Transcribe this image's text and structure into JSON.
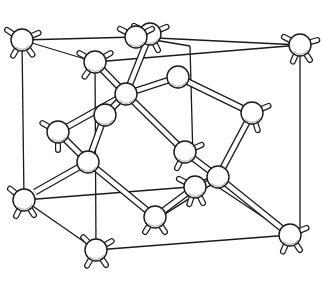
{
  "diagram": {
    "colors": {
      "ink": "#1a1a1a",
      "background": "#ffffff",
      "atom_fill": "#ffffff"
    },
    "atom_radius": 11,
    "cube_edges": [
      [
        22,
        40,
        136,
        37
      ],
      [
        136,
        37,
        300,
        45
      ],
      [
        22,
        40,
        95,
        62
      ],
      [
        136,
        37,
        190,
        46
      ],
      [
        95,
        62,
        300,
        45
      ],
      [
        22,
        40,
        24,
        200
      ],
      [
        95,
        62,
        96,
        250
      ],
      [
        300,
        45,
        300,
        235
      ],
      [
        190,
        46,
        193,
        160
      ],
      [
        24,
        200,
        96,
        250
      ],
      [
        96,
        250,
        290,
        235
      ],
      [
        24,
        200,
        215,
        185
      ],
      [
        215,
        185,
        290,
        235
      ]
    ],
    "bonds": [
      [
        95,
        62,
        126,
        94
      ],
      [
        150,
        34,
        126,
        94
      ],
      [
        126,
        94,
        178,
        77
      ],
      [
        126,
        94,
        58,
        132
      ],
      [
        126,
        94,
        105,
        115
      ],
      [
        126,
        94,
        185,
        152
      ],
      [
        178,
        77,
        252,
        113
      ],
      [
        252,
        113,
        218,
        177
      ],
      [
        58,
        132,
        88,
        162
      ],
      [
        88,
        162,
        35,
        192
      ],
      [
        88,
        162,
        155,
        217
      ],
      [
        88,
        162,
        105,
        115
      ],
      [
        185,
        152,
        218,
        177
      ],
      [
        218,
        177,
        290,
        235
      ],
      [
        218,
        177,
        195,
        187
      ],
      [
        155,
        217,
        218,
        177
      ],
      [
        155,
        217,
        195,
        187
      ]
    ],
    "atoms": [
      {
        "id": "corner-top-back-left",
        "x": 22,
        "y": 40,
        "stubs": [
          [
            -12,
            -8
          ],
          [
            -8,
            14
          ],
          [
            10,
            14
          ],
          [
            14,
            -6
          ]
        ]
      },
      {
        "id": "face-top",
        "x": 150,
        "y": 34,
        "stubs": [
          [
            -12,
            -6
          ],
          [
            14,
            -6
          ],
          [
            6,
            12
          ]
        ]
      },
      {
        "id": "corner-top-back-right",
        "x": 136,
        "y": 37,
        "stubs": [
          [
            -12,
            -6
          ],
          [
            12,
            -6
          ]
        ]
      },
      {
        "id": "corner-top-front-left",
        "x": 95,
        "y": 62,
        "stubs": [
          [
            -14,
            -8
          ],
          [
            14,
            -8
          ],
          [
            -10,
            14
          ]
        ]
      },
      {
        "id": "corner-top-front-right",
        "x": 300,
        "y": 45,
        "stubs": [
          [
            -12,
            -6
          ],
          [
            14,
            -4
          ],
          [
            -6,
            14
          ],
          [
            8,
            12
          ]
        ]
      },
      {
        "id": "interior-1",
        "x": 126,
        "y": 94,
        "stubs": []
      },
      {
        "id": "face-back",
        "x": 178,
        "y": 77,
        "stubs": []
      },
      {
        "id": "face-right",
        "x": 252,
        "y": 113,
        "stubs": [
          [
            14,
            -6
          ],
          [
            4,
            12
          ]
        ]
      },
      {
        "id": "face-left",
        "x": 58,
        "y": 132,
        "stubs": [
          [
            -14,
            -8
          ],
          [
            0,
            14
          ]
        ]
      },
      {
        "id": "interior-2",
        "x": 105,
        "y": 115,
        "stubs": []
      },
      {
        "id": "interior-3",
        "x": 88,
        "y": 162,
        "stubs": []
      },
      {
        "id": "face-front",
        "x": 185,
        "y": 152,
        "stubs": [
          [
            14,
            -6
          ],
          [
            -6,
            12
          ]
        ]
      },
      {
        "id": "interior-4",
        "x": 218,
        "y": 177,
        "stubs": []
      },
      {
        "id": "face-back-lower",
        "x": 195,
        "y": 187,
        "stubs": [
          [
            -12,
            -6
          ],
          [
            -4,
            12
          ],
          [
            6,
            12
          ]
        ]
      },
      {
        "id": "corner-bottom-back-left",
        "x": 24,
        "y": 200,
        "stubs": [
          [
            -10,
            -8
          ],
          [
            -6,
            12
          ],
          [
            8,
            12
          ]
        ]
      },
      {
        "id": "face-bottom",
        "x": 155,
        "y": 217,
        "stubs": [
          [
            -8,
            12
          ],
          [
            8,
            12
          ]
        ]
      },
      {
        "id": "corner-bottom-front-left",
        "x": 96,
        "y": 250,
        "stubs": [
          [
            -12,
            -12
          ],
          [
            14,
            -8
          ],
          [
            -8,
            14
          ],
          [
            8,
            12
          ]
        ]
      },
      {
        "id": "corner-bottom-front-right",
        "x": 290,
        "y": 235,
        "stubs": [
          [
            14,
            -6
          ],
          [
            -6,
            14
          ],
          [
            8,
            12
          ]
        ]
      }
    ]
  }
}
